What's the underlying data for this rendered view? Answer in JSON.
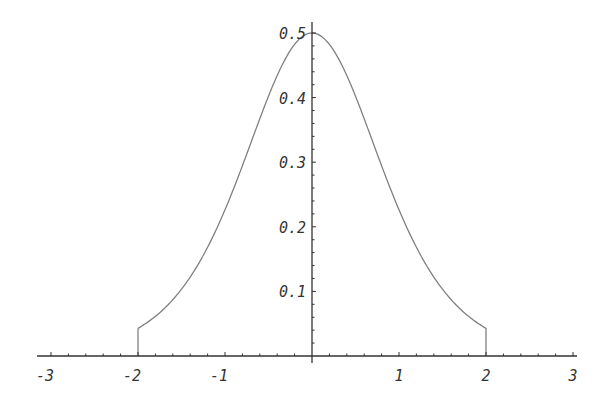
{
  "chart_data": {
    "type": "line",
    "title": "",
    "xlabel": "",
    "ylabel": "",
    "xlim": [
      -3,
      3
    ],
    "ylim": [
      0,
      0.5
    ],
    "grid": false,
    "legend": null,
    "x_ticks": [
      "-3",
      "-2",
      "-1",
      "1",
      "2",
      "3"
    ],
    "y_ticks": [
      "0.1",
      "0.2",
      "0.3",
      "0.4",
      "0.5"
    ],
    "series": [
      {
        "name": "f(x)",
        "domain": [
          -2,
          2
        ],
        "x": [
          -2,
          -1.75,
          -1.5,
          -1.25,
          -1,
          -0.75,
          -0.5,
          -0.25,
          0,
          0.25,
          0.5,
          0.75,
          1,
          1.25,
          1.5,
          1.75,
          2
        ],
        "y": [
          0.048,
          0.072,
          0.108,
          0.158,
          0.235,
          0.322,
          0.405,
          0.474,
          0.5,
          0.474,
          0.405,
          0.322,
          0.235,
          0.158,
          0.108,
          0.072,
          0.048
        ]
      }
    ],
    "annotations": [
      "vertical drop lines at x = -2 and x = 2 from curve to axis"
    ]
  },
  "colors": {
    "axis": "#333333",
    "curve": "#808080"
  }
}
